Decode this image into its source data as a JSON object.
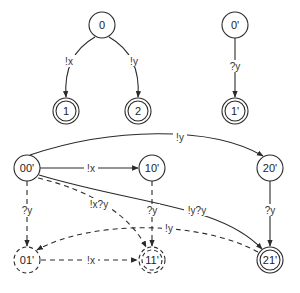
{
  "diagram": {
    "type": "state-machine",
    "nodes": [
      {
        "id": "n0",
        "label": "0",
        "x": 102,
        "y": 25,
        "accepting": false,
        "dashed": false
      },
      {
        "id": "n1",
        "label": "1",
        "x": 66,
        "y": 111,
        "accepting": true,
        "dashed": false
      },
      {
        "id": "n2",
        "label": "2",
        "x": 138,
        "y": 111,
        "accepting": true,
        "dashed": false
      },
      {
        "id": "n0p",
        "label": "0'",
        "x": 235,
        "y": 25,
        "accepting": false,
        "dashed": false
      },
      {
        "id": "n1p",
        "label": "1'",
        "x": 235,
        "y": 111,
        "accepting": true,
        "dashed": false
      },
      {
        "id": "n00p",
        "label": "00'",
        "x": 27,
        "y": 168,
        "accepting": false,
        "dashed": false
      },
      {
        "id": "n10p",
        "label": "10'",
        "x": 152,
        "y": 168,
        "accepting": false,
        "dashed": false
      },
      {
        "id": "n20p",
        "label": "20'",
        "x": 270,
        "y": 168,
        "accepting": false,
        "dashed": false
      },
      {
        "id": "n01p",
        "label": "01'",
        "x": 27,
        "y": 260,
        "accepting": false,
        "dashed": true
      },
      {
        "id": "n11p",
        "label": "11'",
        "x": 152,
        "y": 260,
        "accepting": true,
        "dashed": true
      },
      {
        "id": "n21p",
        "label": "21'",
        "x": 270,
        "y": 260,
        "accepting": true,
        "dashed": false
      }
    ],
    "edges": [
      {
        "from": "0",
        "to": "1",
        "label": "!x",
        "dashed": false
      },
      {
        "from": "0",
        "to": "2",
        "label": "!y",
        "dashed": false
      },
      {
        "from": "0'",
        "to": "1'",
        "label": "?y",
        "dashed": false
      },
      {
        "from": "00'",
        "to": "20'",
        "label": "!y",
        "dashed": false
      },
      {
        "from": "00'",
        "to": "10'",
        "label": "!x",
        "dashed": false
      },
      {
        "from": "00'",
        "to": "21'",
        "label": "!y?y",
        "dashed": false
      },
      {
        "from": "00'",
        "to": "11'",
        "label": "!x?y",
        "dashed": true
      },
      {
        "from": "00'",
        "to": "01'",
        "label": "?y",
        "dashed": true
      },
      {
        "from": "10'",
        "to": "11'",
        "label": "?y",
        "dashed": true
      },
      {
        "from": "20'",
        "to": "21'",
        "label": "?y",
        "dashed": false
      },
      {
        "from": "01'",
        "to": "11'",
        "label": "!x",
        "dashed": true
      },
      {
        "from": "21'",
        "to": "01'",
        "label": "!y",
        "dashed": true
      }
    ]
  }
}
